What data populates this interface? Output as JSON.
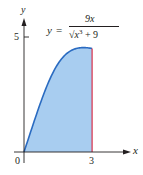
{
  "chart_data": {
    "type": "area",
    "title": "",
    "function_label": {
      "lhs": "y",
      "equals": "=",
      "numerator": "9x",
      "denominator_radical": "√",
      "denominator_var": "x",
      "denominator_exp": "3",
      "denominator_rest": " + 9"
    },
    "formula": "y = 9x / sqrt(x^3 + 9)",
    "xlabel": "x",
    "ylabel": "y",
    "x_ticks": [
      "0",
      "3"
    ],
    "y_ticks": [
      "5"
    ],
    "xlim": [
      0,
      3.6
    ],
    "ylim": [
      0,
      5.5
    ],
    "shaded_region": {
      "from": 0,
      "to": 3
    },
    "boundary_line_x": 3,
    "x": [
      0,
      0.25,
      0.5,
      0.75,
      1,
      1.25,
      1.5,
      1.75,
      2,
      2.25,
      2.5,
      2.75,
      3
    ],
    "values": [
      0,
      0.75,
      1.48,
      2.17,
      2.85,
      3.41,
      3.89,
      4.25,
      4.47,
      4.57,
      4.58,
      4.55,
      4.5
    ],
    "grid": false,
    "legend": "none",
    "colors": {
      "fill": "#a8cdf0",
      "curve": "#2a6bc1",
      "boundary": "#d9304a",
      "axis": "#231f20"
    }
  }
}
